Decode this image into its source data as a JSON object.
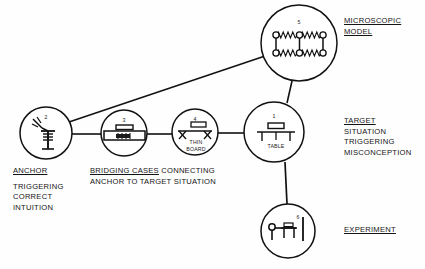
{
  "diagram": {
    "title_text_present": false,
    "colors": {
      "stroke": "#111111",
      "text": "#141414",
      "background": "#fefefe"
    },
    "nodes": [
      {
        "id": "target-situation",
        "number": "1",
        "cx": 274,
        "cy": 132,
        "r": 30,
        "inner_caption": "TABLE",
        "icon": "table-with-weight-icon"
      },
      {
        "id": "anchor",
        "number": "2",
        "cx": 46,
        "cy": 133,
        "r": 26,
        "inner_caption": "",
        "icon": "hand-pressing-spring-icon"
      },
      {
        "id": "bridging-case-foam",
        "number": "3",
        "cx": 124,
        "cy": 133,
        "r": 23,
        "inner_caption": "",
        "icon": "block-on-foam-icon"
      },
      {
        "id": "bridging-case-thin-board",
        "number": "4",
        "cx": 195,
        "cy": 132,
        "r": 23,
        "inner_caption": "THIN BOARD",
        "icon": "thin-board-on-supports-icon"
      },
      {
        "id": "microscopic-model",
        "number": "5",
        "cx": 299,
        "cy": 43,
        "r": 38,
        "inner_caption": "",
        "icon": "spring-lattice-icon"
      },
      {
        "id": "experiment",
        "number": "6",
        "cx": 288,
        "cy": 231,
        "r": 27,
        "inner_caption": "",
        "icon": "laser-apparatus-icon"
      }
    ],
    "edges": [
      {
        "id": "edge-anchor-to-bridging3",
        "from": "anchor",
        "to": "bridging-case-foam"
      },
      {
        "id": "edge-bridging3-to-bridging4",
        "from": "bridging-case-foam",
        "to": "bridging-case-thin-board"
      },
      {
        "id": "edge-bridging4-to-target",
        "from": "bridging-case-thin-board",
        "to": "target-situation"
      },
      {
        "id": "edge-anchor-to-microscopic",
        "from": "anchor",
        "to": "microscopic-model"
      },
      {
        "id": "edge-microscopic-to-target",
        "from": "microscopic-model",
        "to": "target-situation"
      },
      {
        "id": "edge-target-to-experiment",
        "from": "target-situation",
        "to": "experiment"
      }
    ],
    "labels": {
      "microscopic": {
        "line1": "MICROSCOPIC",
        "line2": "MODEL",
        "underlined": [
          "line1",
          "line2"
        ]
      },
      "target": {
        "line1": "TARGET",
        "line2": "SITUATION",
        "line3": "TRIGGERING",
        "line4": "MISCONCEPTION",
        "underlined": [
          "line1"
        ]
      },
      "experiment": {
        "line1": "EXPERIMENT",
        "underlined": [
          "line1"
        ]
      },
      "anchor": {
        "line1": "ANCHOR",
        "line2": "TRIGGERING",
        "line3": "CORRECT",
        "line4": "INTUITION",
        "underlined": [
          "line1"
        ]
      },
      "bridging": {
        "line1_underlined": "BRIDGING CASES",
        "line1_plain": " CONNECTING",
        "line2": "ANCHOR TO TARGET SITUATION"
      }
    },
    "inner_captions": {
      "table": "TABLE",
      "thin_board_line1": "THIN",
      "thin_board_line2": "BOARD"
    },
    "node_numbers": {
      "n1": "1",
      "n2": "2",
      "n3": "3",
      "n4": "4",
      "n5": "5",
      "n6": "6"
    }
  }
}
